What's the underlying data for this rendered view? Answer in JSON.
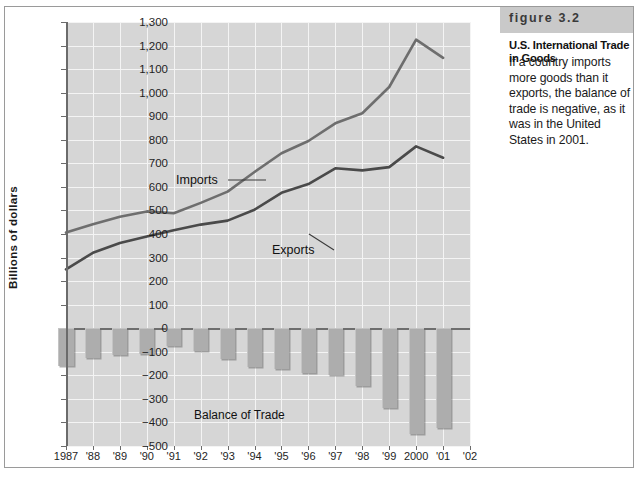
{
  "caption": {
    "figure_number": "figure 3.2",
    "title": "U.S. International Trade in Goods",
    "body": "If a country imports more goods than it exports, the balance of trade is negative, as it was in the United States in 2001."
  },
  "chart_data": {
    "type": "line",
    "title": "U.S. International Trade in Goods",
    "xlabel": "",
    "ylabel": "Billions of dollars",
    "ylim": [
      -500,
      1300
    ],
    "ytick_labels": [
      "1,300",
      "1,200",
      "1,100",
      "1,000",
      "900",
      "800",
      "700",
      "600",
      "500",
      "400",
      "300",
      "200",
      "100",
      "0",
      "-100",
      "-200",
      "-300",
      "-400",
      "-500"
    ],
    "ytick_values": [
      1300,
      1200,
      1100,
      1000,
      900,
      800,
      700,
      600,
      500,
      400,
      300,
      200,
      100,
      0,
      -100,
      -200,
      -300,
      -400,
      -500
    ],
    "categories": [
      "1987",
      "'88",
      "'89",
      "'90",
      "'91",
      "'92",
      "'93",
      "'94",
      "'95",
      "'96",
      "'97",
      "'98",
      "'99",
      "2000",
      "'01",
      "'02"
    ],
    "x_values": [
      1987,
      1988,
      1989,
      1990,
      1991,
      1992,
      1993,
      1994,
      1995,
      1996,
      1997,
      1998,
      1999,
      2000,
      2001,
      2002
    ],
    "grid": true,
    "legend": "inline-annotations",
    "series": [
      {
        "name": "Imports",
        "type": "line",
        "color": "#6e6e6e",
        "x": [
          1987,
          1988,
          1989,
          1990,
          1991,
          1992,
          1993,
          1994,
          1995,
          1996,
          1997,
          1998,
          1999,
          2000,
          2001
        ],
        "values": [
          406,
          441,
          473,
          496,
          488,
          532,
          580,
          663,
          743,
          795,
          870,
          913,
          1024,
          1225,
          1148
        ]
      },
      {
        "name": "Exports",
        "type": "line",
        "color": "#4a4a4a",
        "x": [
          1987,
          1988,
          1989,
          1990,
          1991,
          1992,
          1993,
          1994,
          1995,
          1996,
          1997,
          1998,
          1999,
          2000,
          2001
        ],
        "values": [
          250,
          320,
          362,
          389,
          416,
          440,
          457,
          503,
          575,
          612,
          679,
          670,
          684,
          772,
          724
        ]
      },
      {
        "name": "Balance of Trade",
        "type": "bar",
        "color": "#adadad",
        "x": [
          1987,
          1988,
          1989,
          1990,
          1991,
          1992,
          1993,
          1994,
          1995,
          1996,
          1997,
          1998,
          1999,
          2000,
          2001
        ],
        "values": [
          -160,
          -127,
          -115,
          -111,
          -74,
          -96,
          -132,
          -166,
          -174,
          -191,
          -198,
          -247,
          -340,
          -450,
          -425
        ]
      }
    ],
    "annotations": [
      {
        "text": "Imports",
        "name": "imports-label"
      },
      {
        "text": "Exports",
        "name": "exports-label"
      },
      {
        "text": "Balance of Trade",
        "name": "balance-of-trade-label"
      }
    ]
  }
}
